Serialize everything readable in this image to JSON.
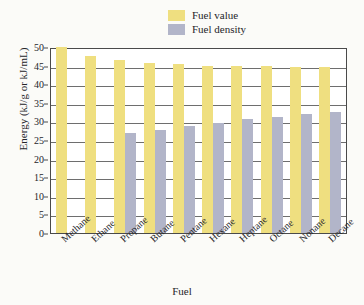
{
  "chart_data": {
    "type": "bar",
    "title": "",
    "xlabel": "Fuel",
    "ylabel": "Energy (kJ/g or kJ/mL)",
    "ylim": [
      0,
      50
    ],
    "yticks": [
      0,
      5,
      10,
      15,
      20,
      25,
      30,
      35,
      40,
      45,
      50
    ],
    "grid": true,
    "legend_position": "top-center",
    "categories": [
      "Methane",
      "Ethane",
      "Propane",
      "Butane",
      "Pentane",
      "Hexane",
      "Heptane",
      "Octane",
      "Nonane",
      "Decane"
    ],
    "series": [
      {
        "name": "Fuel value",
        "color": "#efdf80",
        "values": [
          50.0,
          47.6,
          46.4,
          45.8,
          45.3,
          44.9,
          44.9,
          44.8,
          44.6,
          44.5
        ]
      },
      {
        "name": "Fuel density",
        "color": "#b2b5c9",
        "values": [
          null,
          null,
          27.0,
          27.8,
          28.7,
          29.7,
          30.6,
          31.3,
          32.0,
          32.5
        ]
      }
    ]
  },
  "legend": {
    "items": [
      {
        "label": "Fuel value",
        "color": "#efdf80"
      },
      {
        "label": "Fuel density",
        "color": "#b2b5c9"
      }
    ]
  },
  "axes": {
    "y_title": "Energy (kJ/g or kJ/mL)",
    "x_title": "Fuel",
    "y_tick_labels": [
      "50",
      "45",
      "40",
      "35",
      "30",
      "25",
      "20",
      "15",
      "10",
      "5",
      "0"
    ],
    "x_tick_labels": [
      "Methane",
      "Ethane",
      "Propane",
      "Butane",
      "Pentane",
      "Hexane",
      "Heptane",
      "Octane",
      "Nonane",
      "Decane"
    ]
  }
}
